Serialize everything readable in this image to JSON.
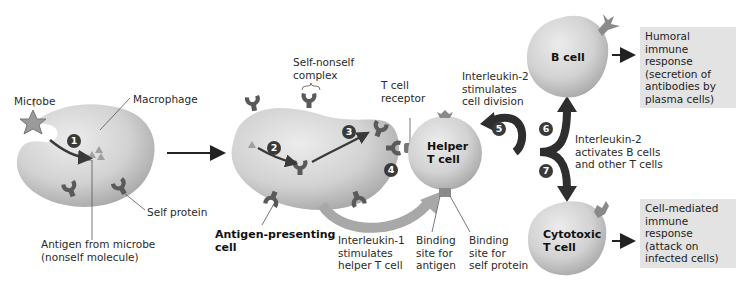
{
  "diagram": {
    "labels": {
      "microbe": "Microbe",
      "macrophage": "Macrophage",
      "self_protein": "Self protein",
      "antigen_from_microbe": [
        "Antigen from microbe",
        "(nonself molecule)"
      ],
      "self_nonself_complex": [
        "Self-nonself",
        "complex"
      ],
      "t_cell_receptor": [
        "T cell",
        "receptor"
      ],
      "antigen_presenting_cell": [
        "Antigen-presenting",
        "cell"
      ],
      "interleukin_1": [
        "Interleukin-1",
        "stimulates",
        "helper T cell"
      ],
      "binding_site_antigen": [
        "Binding",
        "site for",
        "antigen"
      ],
      "binding_site_self": [
        "Binding",
        "site for",
        "self protein"
      ],
      "interleukin_2_division": [
        "Interleukin-2",
        "stimulates",
        "cell division"
      ],
      "interleukin_2_activates": [
        "Interleukin-2",
        "activates B cells",
        "and other T cells"
      ]
    },
    "cells": {
      "helper_t": [
        "Helper",
        "T cell"
      ],
      "b_cell": [
        "B cell"
      ],
      "cytotoxic_t": [
        "Cytotoxic",
        "T cell"
      ]
    },
    "outcomes": {
      "humoral": [
        "Humoral",
        "immune",
        "response",
        "(secretion of",
        "antibodies by",
        "plasma cells)"
      ],
      "cell_mediated": [
        "Cell-mediated",
        "immune",
        "response",
        "(attack on",
        "infected cells)"
      ]
    },
    "steps": [
      "1",
      "2",
      "3",
      "4",
      "5",
      "6",
      "7"
    ],
    "colors": {
      "cell_fill": "#d4d4d4",
      "cell_shade": "#a9a9a9",
      "protein": "#555555",
      "arrow_dark": "#2e2e2e",
      "arrow_light": "#a8a8a8",
      "outcome_box": "#e3e3e3"
    }
  }
}
